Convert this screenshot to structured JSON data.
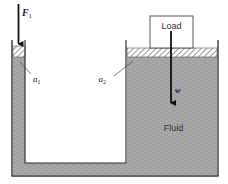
{
  "diagram": {
    "labels": {
      "force": "F",
      "force_sub": "1",
      "area_small": "a",
      "area_small_sub": "1",
      "area_large": "a",
      "area_large_sub": "2",
      "load": "Load",
      "weight": "w",
      "fluid": "Fluid"
    },
    "colors": {
      "fluid": "#a8a8a8",
      "fluid_line": "#8c8c8c",
      "wall": "#333333",
      "piston_hatch": "#555555",
      "background": "#ffffff"
    }
  }
}
